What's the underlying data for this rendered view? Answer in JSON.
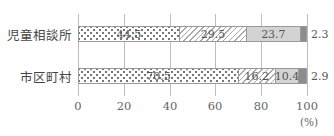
{
  "chart_data": {
    "type": "bar",
    "orientation": "horizontal",
    "stacked": true,
    "title": "",
    "xlabel": "",
    "ylabel": "",
    "unit_label": "(%)",
    "xlim": [
      0,
      100
    ],
    "x_ticks": [
      "0",
      "20",
      "40",
      "60",
      "80",
      "100"
    ],
    "grid": true,
    "legend": [],
    "categories": [
      "児童相談所",
      "市区町村"
    ],
    "series": [
      {
        "name": "segment-1 (dotted)",
        "pattern": "dots",
        "color": "#ffffff",
        "values": [
          44.5,
          70.5
        ]
      },
      {
        "name": "segment-2 (hatched)",
        "pattern": "hatch",
        "color": "#ffffff",
        "values": [
          29.5,
          16.2
        ]
      },
      {
        "name": "segment-3 (light gray)",
        "pattern": "solid",
        "color": "#d3d3d3",
        "values": [
          23.7,
          10.4
        ]
      },
      {
        "name": "segment-4 (dark gray)",
        "pattern": "solid",
        "color": "#8c8c8c",
        "values": [
          2.3,
          2.9
        ]
      }
    ],
    "labels": {
      "row0": [
        "44.5",
        "29.5",
        "23.7",
        "2.3"
      ],
      "row1": [
        "70.5",
        "16.2",
        "10.4",
        "2.9"
      ]
    }
  }
}
